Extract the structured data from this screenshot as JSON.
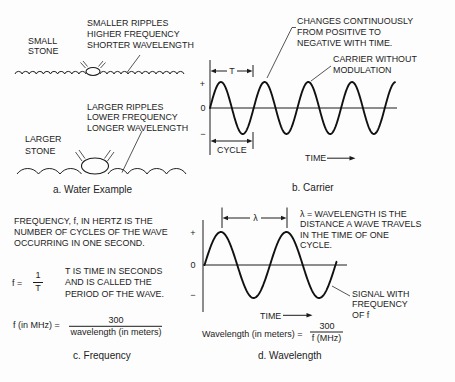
{
  "water": {
    "caption": "a. Water Example",
    "small_stone_label": [
      "SMALL",
      "STONE"
    ],
    "small_ripples_note": [
      "SMALLER RIPPLES",
      "HIGHER FREQUENCY",
      "SHORTER WAVELENGTH"
    ],
    "large_stone_label": [
      "LARGER",
      "STONE"
    ],
    "large_ripples_note": [
      "LARGER RIPPLES",
      "LOWER FREQUENCY",
      "LONGER WAVELENGTH"
    ]
  },
  "carrier": {
    "caption": "b. Carrier",
    "note_changes": [
      "CHANGES CONTINUOUSLY",
      "FROM POSITIVE TO",
      "NEGATIVE WITH TIME."
    ],
    "note_carrier": [
      "CARRIER WITHOUT",
      "MODULATION"
    ],
    "axis": {
      "plus": "+",
      "zero": "0",
      "minus": "−"
    },
    "period_label": "T",
    "cycle_label": "CYCLE",
    "time_label": "TIME"
  },
  "frequency": {
    "caption": "c. Frequency",
    "definition": [
      "FREQUENCY, f, IN HERTZ IS THE",
      "NUMBER OF CYCLES OF THE WAVE",
      "OCCURRING IN ONE SECOND."
    ],
    "formula1": {
      "lhs": "f =",
      "numerator": "1",
      "denominator": "T"
    },
    "period_note": [
      "T IS TIME IN SECONDS",
      "AND IS CALLED THE",
      "PERIOD OF THE WAVE."
    ],
    "formula2": {
      "lhs": "f (in MHz) =",
      "numerator": "300",
      "denominator": "wavelength (in meters)"
    }
  },
  "wavelength": {
    "caption": "d. Wavelength",
    "definition": [
      "λ = WAVELENGTH IS THE",
      "DISTANCE A WAVE TRAVELS",
      "IN THE TIME OF ONE",
      "CYCLE."
    ],
    "signal_note": [
      "SIGNAL WITH",
      "FREQUENCY",
      "OF f"
    ],
    "axis": {
      "plus": "+",
      "zero": "0",
      "minus": "−"
    },
    "lambda_label": "λ",
    "time_label": "TIME",
    "formula": {
      "lhs": "Wavelength (in meters) =",
      "numerator": "300",
      "denominator": "f (MHz)"
    }
  }
}
